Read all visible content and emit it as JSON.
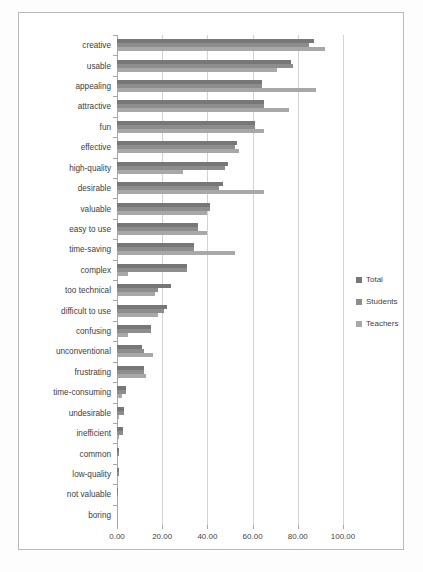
{
  "chart_data": {
    "type": "bar",
    "orientation": "horizontal",
    "title": "",
    "xlabel": "",
    "ylabel": "",
    "xlim": [
      0,
      100
    ],
    "xticks": [
      "0.00",
      "20.00",
      "40.00",
      "60.00",
      "80.00",
      "100.00"
    ],
    "xtick_values": [
      0,
      20,
      40,
      60,
      80,
      100
    ],
    "grid": true,
    "legend_position": "right",
    "categories": [
      "creative",
      "usable",
      "appealing",
      "attractive",
      "fun",
      "effective",
      "high-quality",
      "desirable",
      "valuable",
      "easy to use",
      "time-saving",
      "complex",
      "too technical",
      "difficult to use",
      "confusing",
      "unconventional",
      "frustrating",
      "time-consuming",
      "undesirable",
      "inefficient",
      "common",
      "low-quality",
      "not valuable",
      "boring"
    ],
    "series": [
      {
        "name": "Total",
        "color": "#777777",
        "values": [
          87,
          77,
          64,
          65,
          61,
          53,
          49,
          47,
          41,
          36,
          34,
          31,
          24,
          22,
          15,
          11,
          12,
          4,
          3,
          2.5,
          1,
          0.7,
          0.5,
          0
        ]
      },
      {
        "name": "Students",
        "color": "#8d8d8d",
        "values": [
          85,
          78,
          64,
          65,
          61,
          52,
          48,
          45,
          41,
          36,
          34,
          31,
          18,
          21,
          15,
          12,
          12,
          4,
          3,
          2.5,
          1,
          0.7,
          0.5,
          0
        ]
      },
      {
        "name": "Teachers",
        "color": "#a8a8a8",
        "values": [
          92,
          71,
          88,
          76,
          65,
          54,
          29,
          65,
          40,
          40,
          52,
          5,
          17,
          18,
          5,
          16,
          13,
          2,
          1,
          1,
          0.5,
          0.4,
          0.3,
          0
        ]
      }
    ]
  },
  "legend": {
    "items": [
      {
        "label": "Total",
        "color": "#777777"
      },
      {
        "label": "Students",
        "color": "#8d8d8d"
      },
      {
        "label": "Teachers",
        "color": "#a8a8a8"
      }
    ]
  }
}
